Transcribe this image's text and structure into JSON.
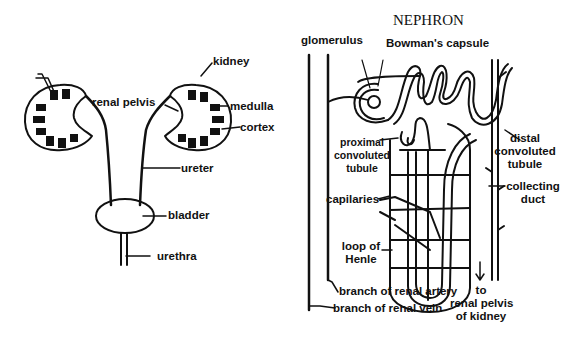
{
  "left_diagram": {
    "name": "urinary system",
    "labels": {
      "kidney": "kidney",
      "renal_pelvis": "renal pelvis",
      "medulla": "medulla",
      "cortex": "cortex",
      "ureter": "ureter",
      "bladder": "bladder",
      "urethra": "urethra"
    }
  },
  "right_diagram": {
    "title": "NEPHRON",
    "labels": {
      "glomerulus": "glomerulus",
      "bowmans_capsule": "Bowman's capsule",
      "proximal_1": "proximal",
      "proximal_2": "convoluted",
      "proximal_3": "tubule",
      "distal_1": "distal",
      "distal_2": "convoluted",
      "distal_3": "tubule",
      "collecting_1": "collecting",
      "collecting_2": "duct",
      "capilaries": "capilaries",
      "loop_1": "loop of",
      "loop_2": "Henle",
      "renal_artery": "branch of renal artery",
      "renal_vein": "branch of renal vein",
      "to_1": "to",
      "to_2": "renal pelvis",
      "to_3": "of  kidney"
    }
  },
  "colors": {
    "ink": "#111111",
    "background": "#ffffff"
  }
}
